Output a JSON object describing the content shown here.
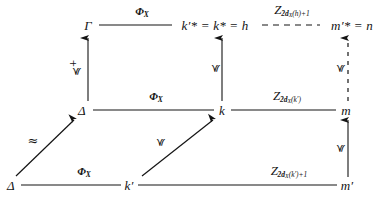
{
  "figure": {
    "type": "commutative-diagram",
    "background_color": "#ffffff",
    "ink_color": "#141414"
  },
  "nodes": [
    {
      "id": "gamma-top",
      "label": "Γ",
      "row": "top",
      "col": "left",
      "x": 88,
      "y": 25
    },
    {
      "id": "h-top",
      "label": "k′* = k* = h",
      "row": "top",
      "col": "middle",
      "x": 215,
      "y": 25
    },
    {
      "id": "n-top",
      "label": "m′* = n",
      "row": "top",
      "col": "right",
      "x": 352,
      "y": 25
    },
    {
      "id": "delta-mid",
      "label": "Δ",
      "row": "middle",
      "col": "left",
      "x": 82,
      "y": 110
    },
    {
      "id": "k-mid",
      "label": "k",
      "row": "middle",
      "col": "middle",
      "x": 222,
      "y": 110
    },
    {
      "id": "m-mid",
      "label": "m",
      "row": "middle",
      "col": "right",
      "x": 346,
      "y": 110
    },
    {
      "id": "delta-bot",
      "label": "Δ",
      "row": "bottom",
      "col": "far-left",
      "x": 11,
      "y": 185
    },
    {
      "id": "kprime-bot",
      "label": "k′",
      "row": "bottom",
      "col": "left",
      "x": 129,
      "y": 185
    },
    {
      "id": "mprime-bot",
      "label": "m′",
      "row": "bottom",
      "col": "right",
      "x": 347,
      "y": 185
    }
  ],
  "edges": [
    {
      "id": "gamma-to-h",
      "from": "gamma-top",
      "to": "h-top",
      "style": "solid",
      "direction": "horizontal-right",
      "arrowhead": false,
      "label": {
        "text": "Φ",
        "sub": "X",
        "x": 142,
        "y": 12,
        "kind": "phi"
      }
    },
    {
      "id": "h-to-n",
      "from": "h-top",
      "to": "n-top",
      "style": "dashed",
      "direction": "horizontal-right",
      "arrowhead": false,
      "label": {
        "text": "Z",
        "sub": "2d",
        "subsub": "X",
        "subtail": "(h)+1",
        "x": 292,
        "y": 11,
        "kind": "script-z"
      }
    },
    {
      "id": "delta-to-k",
      "from": "delta-mid",
      "to": "k-mid",
      "style": "solid",
      "direction": "horizontal-right",
      "arrowhead": false,
      "label": {
        "text": "Φ",
        "sub": "X",
        "x": 156,
        "y": 97,
        "kind": "phi"
      }
    },
    {
      "id": "k-to-m",
      "from": "k-mid",
      "to": "m-mid",
      "style": "solid",
      "direction": "horizontal-right",
      "arrowhead": false,
      "label": {
        "text": "Z",
        "sub": "2d",
        "subsub": "X",
        "subtail": "(k′)",
        "x": 287,
        "y": 97,
        "kind": "script-z"
      }
    },
    {
      "id": "deltabot-to-kprime",
      "from": "delta-bot",
      "to": "kprime-bot",
      "style": "solid",
      "direction": "horizontal-right",
      "arrowhead": false,
      "label": {
        "text": "Φ",
        "sub": "X",
        "x": 84,
        "y": 172,
        "kind": "phi"
      }
    },
    {
      "id": "kprime-to-mprime",
      "from": "kprime-bot",
      "to": "mprime-bot",
      "style": "solid",
      "direction": "horizontal-right",
      "arrowhead": false,
      "label": {
        "text": "Z",
        "sub": "2d",
        "subsub": "X",
        "subtail": "(k′)+1",
        "x": 289,
        "y": 172,
        "kind": "script-z"
      }
    },
    {
      "id": "delta-to-gamma",
      "from": "delta-mid",
      "to": "gamma-top",
      "style": "solid",
      "direction": "vertical-up",
      "arrowhead": true,
      "label": {
        "text": "≼",
        "sup": "+",
        "x": 75,
        "y": 68,
        "kind": "preceq-plus",
        "rotated": true
      }
    },
    {
      "id": "k-to-h",
      "from": "k-mid",
      "to": "h-top",
      "style": "solid",
      "direction": "vertical-up",
      "arrowhead": true,
      "label": {
        "text": "≼",
        "x": 215,
        "y": 68,
        "kind": "preceq",
        "rotated": true
      }
    },
    {
      "id": "m-to-n",
      "from": "m-mid",
      "to": "n-top",
      "style": "dashed",
      "direction": "vertical-up",
      "arrowhead": true,
      "label": {
        "text": "≼",
        "x": 340,
        "y": 68,
        "kind": "preceq",
        "rotated": true
      }
    },
    {
      "id": "mprime-to-m",
      "from": "mprime-bot",
      "to": "m-mid",
      "style": "solid",
      "direction": "vertical-up",
      "arrowhead": true,
      "label": {
        "text": "≼",
        "x": 340,
        "y": 148,
        "kind": "preceq",
        "rotated": true
      }
    },
    {
      "id": "deltabot-to-deltamid",
      "from": "delta-bot",
      "to": "delta-mid",
      "style": "solid",
      "direction": "diagonal-up-right",
      "arrowhead": true,
      "label": {
        "text": "≈",
        "x": 33,
        "y": 140,
        "kind": "approx",
        "rotated": false
      }
    },
    {
      "id": "kprime-to-k",
      "from": "kprime-bot",
      "to": "k-mid",
      "style": "solid",
      "direction": "diagonal-up-right",
      "arrowhead": true,
      "label": {
        "text": "≼",
        "x": 160,
        "y": 142,
        "kind": "preceq",
        "rotated": true
      }
    }
  ],
  "labels": {
    "phi_x": "Φ_X",
    "script_z": "Z",
    "preceq": "≼",
    "preceq_plus": "≼+",
    "approx": "≈"
  }
}
